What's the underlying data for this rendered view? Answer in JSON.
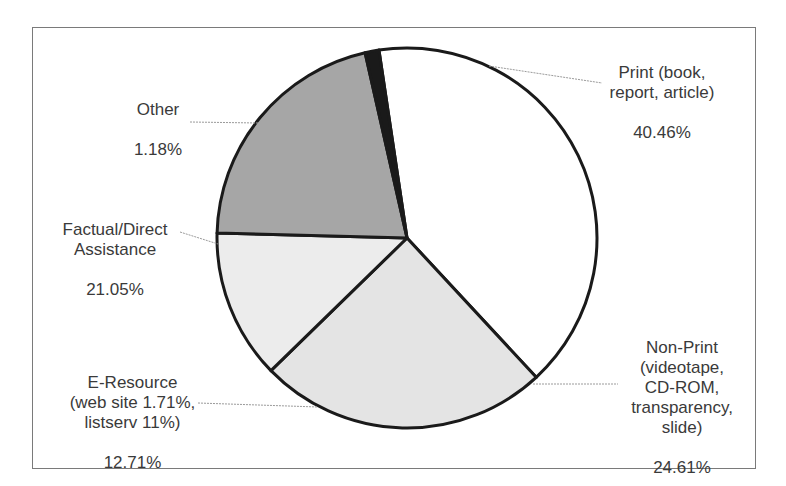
{
  "chart_data": {
    "type": "pie",
    "title": "",
    "slices": [
      {
        "label": "Print (book, report, article)",
        "value": 40.46,
        "color": "#ffffff"
      },
      {
        "label": "Non-Print (videotape, CD-ROM, transparency, slide)",
        "value": 24.61,
        "color": "#e4e4e4"
      },
      {
        "label": "E-Resource (web site 1.71%, listserv 11%)",
        "value": 12.71,
        "color": "#ececec"
      },
      {
        "label": "Factual/Direct Assistance",
        "value": 21.05,
        "color": "#a6a6a6"
      },
      {
        "label": "Other",
        "value": 1.18,
        "color": "#1a1a1a"
      }
    ],
    "start_angle_deg": -8.5,
    "direction": "clockwise",
    "legend": "none (direct labels with leader lines)"
  },
  "labels": {
    "print": {
      "name": "Print (book,\nreport, article)",
      "pct": "40.46%"
    },
    "other": {
      "name": "Other",
      "pct": "1.18%"
    },
    "factual": {
      "name": "Factual/Direct\nAssistance",
      "pct": "21.05%"
    },
    "eresource": {
      "name": "E-Resource\n(web site 1.71%,\nlistserv 11%)",
      "pct": "12.71%"
    },
    "nonprint": {
      "name": "Non-Print\n(videotape,\nCD-ROM,\ntransparency,\nslide)",
      "pct": "24.61%"
    }
  },
  "colors": {
    "frame": "#7a7a7a",
    "outline": "#1a1a1a",
    "text": "#3a3a3a",
    "leader": "#9a9a9a"
  }
}
